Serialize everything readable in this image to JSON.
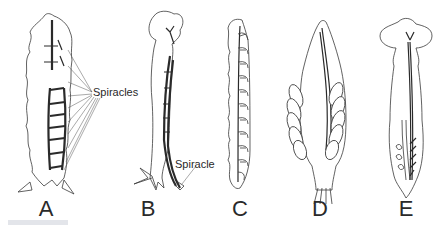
{
  "figure": {
    "panels": [
      {
        "id": "A",
        "label": "A",
        "annotation": "Spiracles"
      },
      {
        "id": "B",
        "label": "B",
        "annotation": "Spiracle"
      },
      {
        "id": "C",
        "label": "C",
        "annotation": ""
      },
      {
        "id": "D",
        "label": "D",
        "annotation": ""
      },
      {
        "id": "E",
        "label": "E",
        "annotation": ""
      }
    ]
  }
}
